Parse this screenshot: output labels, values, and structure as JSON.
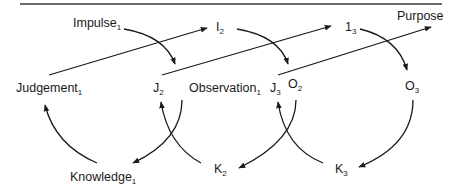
{
  "diagram": {
    "top_rule": true,
    "nodes": {
      "impulse1": {
        "base": "Impulse",
        "sub": "1"
      },
      "i2": {
        "base": "I",
        "sub": "2"
      },
      "i3": {
        "base": "1",
        "sub": "3"
      },
      "purpose": {
        "base": "Purpose",
        "sub": ""
      },
      "judgement1": {
        "base": "Judgement",
        "sub": "1"
      },
      "j2": {
        "base": "J",
        "sub": "2"
      },
      "observation1": {
        "base": "Observation",
        "sub": "1"
      },
      "j3": {
        "base": "J",
        "sub": "3"
      },
      "o2": {
        "base": "O",
        "sub": "2"
      },
      "o3": {
        "base": "O",
        "sub": "3"
      },
      "knowledge1": {
        "base": "Knowledge",
        "sub": "1"
      },
      "k2": {
        "base": "K",
        "sub": "2"
      },
      "k3": {
        "base": "K",
        "sub": "3"
      }
    },
    "edges": [
      {
        "from": "Judgement1",
        "to": "I2",
        "style": "straight"
      },
      {
        "from": "J2",
        "to": "I3",
        "style": "straight"
      },
      {
        "from": "J3",
        "to": "Purpose",
        "style": "straight"
      },
      {
        "from": "Impulse1",
        "to": "J2",
        "style": "curved"
      },
      {
        "from": "I2",
        "to": "O2",
        "style": "curved"
      },
      {
        "from": "I3",
        "to": "O3",
        "style": "curved"
      },
      {
        "from": "Observation1",
        "to": "Knowledge1",
        "style": "curved"
      },
      {
        "from": "Knowledge1",
        "to": "Judgement1",
        "style": "curved"
      },
      {
        "from": "K2",
        "to": "J2",
        "style": "curved"
      },
      {
        "from": "O2",
        "to": "K2",
        "style": "curved"
      },
      {
        "from": "K3",
        "to": "J3",
        "style": "curved"
      },
      {
        "from": "O3",
        "to": "K3",
        "style": "curved"
      }
    ]
  }
}
